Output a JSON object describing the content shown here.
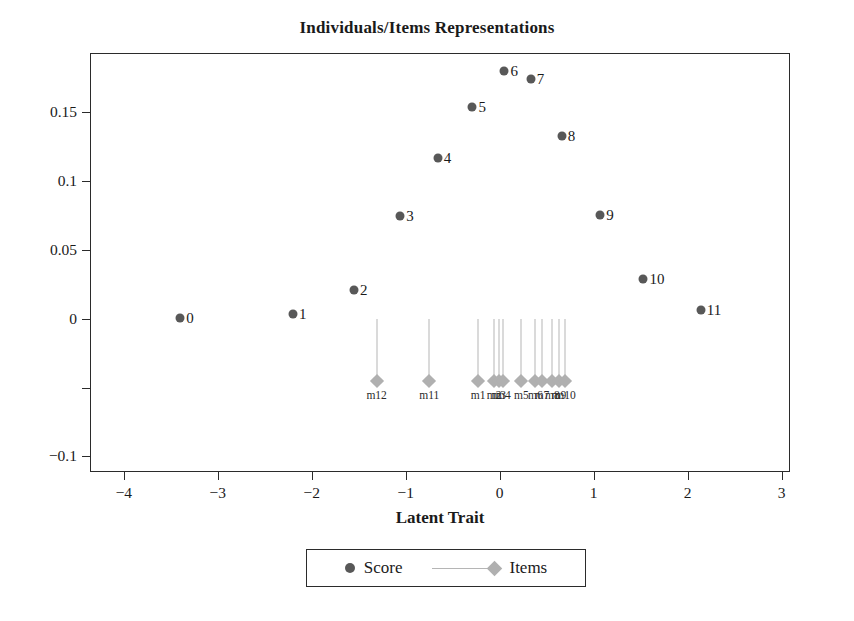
{
  "chart_data": {
    "type": "scatter",
    "title": "Individuals/Items Representations",
    "xlabel": "Latent Trait",
    "ylabel": "",
    "xlim": [
      -4.35,
      3.1
    ],
    "ylim": [
      -0.112,
      0.192
    ],
    "grid": false,
    "legend_position": "bottom-center",
    "xticks": [
      -4,
      -3,
      -2,
      -1,
      0,
      1,
      2,
      3
    ],
    "xticklabels": [
      "−4",
      "−3",
      "−2",
      "−1",
      "0",
      "1",
      "2",
      "3"
    ],
    "yticks": [
      -0.1,
      -0.05,
      0,
      0.05,
      0.1,
      0.15
    ],
    "yticklabels": [
      "−0.1",
      "",
      "0",
      "0.05",
      "0.1",
      "0.15"
    ],
    "series": [
      {
        "name": "Score",
        "marker": "circle",
        "color": "#585858",
        "points": [
          {
            "label": "0",
            "x": -3.4,
            "y": 0.0005
          },
          {
            "label": "1",
            "x": -2.2,
            "y": 0.0035
          },
          {
            "label": "2",
            "x": -1.55,
            "y": 0.0205
          },
          {
            "label": "3",
            "x": -1.06,
            "y": 0.0745
          },
          {
            "label": "4",
            "x": -0.66,
            "y": 0.1165
          },
          {
            "label": "5",
            "x": -0.29,
            "y": 0.1535
          },
          {
            "label": "6",
            "x": 0.05,
            "y": 0.1795
          },
          {
            "label": "7",
            "x": 0.33,
            "y": 0.1735
          },
          {
            "label": "8",
            "x": 0.66,
            "y": 0.1325
          },
          {
            "label": "9",
            "x": 1.07,
            "y": 0.0755
          },
          {
            "label": "10",
            "x": 1.53,
            "y": 0.0285
          },
          {
            "label": "11",
            "x": 2.14,
            "y": 0.0065
          }
        ]
      },
      {
        "name": "Items",
        "marker": "diamond",
        "color": "#b0b0b0",
        "stem_top": 0.0,
        "points": [
          {
            "label": "m12",
            "x": -1.31,
            "y": -0.0455
          },
          {
            "label": "m11",
            "x": -0.75,
            "y": -0.0455
          },
          {
            "label": "m1",
            "x": -0.23,
            "y": -0.0455
          },
          {
            "label": "m2",
            "x": -0.06,
            "y": -0.0455
          },
          {
            "label": "m3",
            "x": -0.01,
            "y": -0.0455
          },
          {
            "label": "m4",
            "x": 0.04,
            "y": -0.0455
          },
          {
            "label": "m5",
            "x": 0.23,
            "y": -0.0455
          },
          {
            "label": "m6",
            "x": 0.38,
            "y": -0.0455
          },
          {
            "label": "m7",
            "x": 0.45,
            "y": -0.0455
          },
          {
            "label": "m8",
            "x": 0.56,
            "y": -0.0455
          },
          {
            "label": "m9",
            "x": 0.63,
            "y": -0.0455
          },
          {
            "label": "m10",
            "x": 0.7,
            "y": -0.0455
          }
        ]
      }
    ]
  },
  "legend": {
    "entries": [
      {
        "label": "Score",
        "icon": "filled-circle-marker"
      },
      {
        "label": "Items",
        "icon": "line-with-diamond-marker"
      }
    ]
  }
}
